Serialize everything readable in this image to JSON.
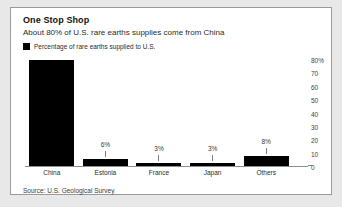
{
  "header": {
    "title": "One Stop Shop",
    "subtitle": "About 80% of U.S. rare earths supplies come from China"
  },
  "legend": {
    "swatch_color": "#000000",
    "label": "Percentage of rare earths supplied to U.S."
  },
  "footer": {
    "source": "Source: U.S. Geological Survey"
  },
  "chart_data": {
    "type": "bar",
    "title": "One Stop Shop",
    "subtitle": "About 80% of U.S. rare earths supplies come from China",
    "xlabel": "",
    "ylabel": "",
    "ylim": [
      0,
      80
    ],
    "grid": false,
    "legend_position": "top-left",
    "bar_color": "#000000",
    "categories": [
      "China",
      "Estonia",
      "France",
      "Japan",
      "Others"
    ],
    "values": [
      80,
      6,
      3,
      3,
      8
    ],
    "data_labels": [
      "",
      "6%",
      "3%",
      "3%",
      "8%"
    ],
    "series": [
      {
        "name": "Percentage of rare earths supplied to U.S.",
        "values": [
          80,
          6,
          3,
          3,
          8
        ]
      }
    ],
    "ytick_labels": [
      "80%",
      "70",
      "60",
      "50",
      "40",
      "30",
      "20",
      "10",
      "0"
    ],
    "ytick_values": [
      80,
      70,
      60,
      50,
      40,
      30,
      20,
      10,
      0
    ],
    "source": "Source: U.S. Geological Survey"
  }
}
